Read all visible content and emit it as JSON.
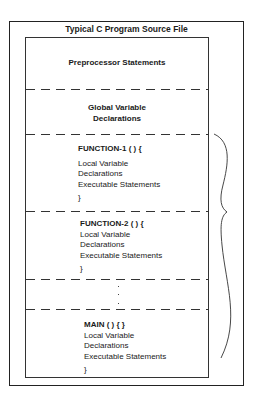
{
  "title": "Typical C Program Source File",
  "sections": {
    "preprocessor": "Preprocessor Statements",
    "globals": [
      "Global Variable",
      "Declarations"
    ],
    "function1": {
      "header": "FUNCTION-1 ( ) {",
      "lines": [
        "Local Variable",
        "Declarations",
        "Executable Statements"
      ],
      "close": "}"
    },
    "function2": {
      "header": "FUNCTION-2 ( ) {",
      "lines": [
        "Local Variable",
        "Declarations",
        "Executable Statements"
      ],
      "close": "}"
    },
    "ellipsis": ".",
    "main": {
      "header": "MAIN ( ) {  }",
      "lines": [
        "Local Variable",
        "Declarations",
        "Executable Statements"
      ],
      "close": "}"
    }
  },
  "colors": {
    "line": "#222222",
    "text": "#1a1a1a",
    "background": "#ffffff"
  }
}
